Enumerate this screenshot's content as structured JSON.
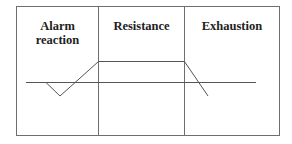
{
  "diagram": {
    "stages": [
      {
        "label_line1": "Alarm",
        "label_line2": "reaction"
      },
      {
        "label_line1": "Resistance",
        "label_line2": ""
      },
      {
        "label_line1": "Exhaustion",
        "label_line2": ""
      }
    ],
    "colors": {
      "frame": "#6e6e6e",
      "curve": "#555555",
      "text": "#222222",
      "background": "#ffffff"
    }
  }
}
